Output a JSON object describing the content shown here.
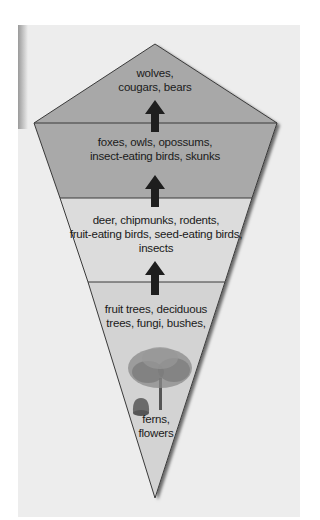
{
  "diagram": {
    "type": "food-pyramid-kite",
    "levels": [
      {
        "id": "tertiary",
        "label_line1": "wolves,",
        "label_line2": "cougars, bears",
        "label_line3": "",
        "color": "#a8a8a8"
      },
      {
        "id": "secondary",
        "label_line1": "foxes, owls, opossums,",
        "label_line2": "insect-eating birds, skunks",
        "label_line3": "",
        "color": "#a9a9a9"
      },
      {
        "id": "primary",
        "label_line1": "deer, chipmunks, rodents,",
        "label_line2": "fruit-eating birds, seed-eating birds,",
        "label_line3": "insects",
        "color": "#dcdcdc"
      },
      {
        "id": "producers",
        "label_line1": "fruit trees, deciduous",
        "label_line2": "trees, fungi, bushes,",
        "label_line3": "",
        "label_extra1": "ferns,",
        "label_extra2": "flowers",
        "color": "#d3d3d3"
      }
    ],
    "arrows": [
      "up-arrow",
      "up-arrow",
      "up-arrow"
    ],
    "colors": {
      "background": "#ededed",
      "outline": "#3a3a3a",
      "arrow": "#1e1e1e"
    }
  }
}
